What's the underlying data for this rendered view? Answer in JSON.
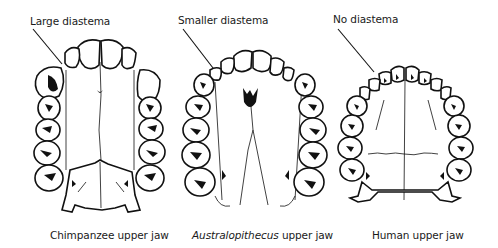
{
  "figure": {
    "jaws": [
      {
        "id": "chimpanzee",
        "annotation": "Large diastema",
        "caption_main": "Chimpanzee",
        "caption_italic": "",
        "caption_suffix": " upper jaw"
      },
      {
        "id": "australopithecus",
        "annotation": "Smaller diastema",
        "caption_main": "",
        "caption_italic": "Australopithecus",
        "caption_suffix": " upper jaw"
      },
      {
        "id": "human",
        "annotation": "No diastema",
        "caption_main": "Human",
        "caption_italic": "",
        "caption_suffix": " upper jaw"
      }
    ]
  }
}
